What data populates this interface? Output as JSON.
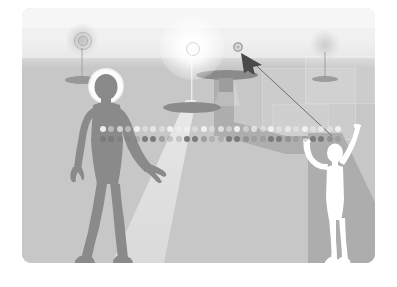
{
  "scene": {
    "title": "Grayscale conceptual illustration: two figures, three lamps, pointer arrow and dotted connection line",
    "palette": {
      "page_background": "#ffffff",
      "sky_light": "#f6f6f6",
      "sky_band": "#efefef",
      "ground": "#c7c7c7",
      "ground_band": "#d8d8d8",
      "dark_figure": "#8a8a8a",
      "dark_figure_deep": "#7e7e7e",
      "white_figure": "#ffffff",
      "shadow_gray": "#acacac",
      "lamp_base_dark": "#8b8b8b",
      "arrow_dark": "#4a4a4a",
      "dot_light": "#f2f2f2",
      "dot_dark": "#7b7b7b",
      "bright_glow": "#ffffff"
    },
    "frame": {
      "x": 22,
      "y": 8,
      "width": 353,
      "height": 255,
      "corner_radius": 9
    }
  },
  "lamps": [
    {
      "name": "left-lamp",
      "label": "Dim lamp with concentric rings",
      "brightness": "dim",
      "glow_color": "#c2c2c2",
      "has_rings": true,
      "pole": true,
      "base_ellipse": true
    },
    {
      "name": "center-lamp",
      "label": "Bright white lamp",
      "brightness": "bright",
      "glow_color": "#ffffff",
      "has_rings": false,
      "pole": true,
      "base_ellipse": true,
      "casts_light_cone": true
    },
    {
      "name": "right-lamp",
      "label": "Faint background lamp",
      "brightness": "faint",
      "glow_color": "#c8c8c8",
      "has_rings": false,
      "pole": true,
      "base_ellipse": true
    },
    {
      "name": "shadow-caster-lamp",
      "label": "Mid lamp disc casting bent shadow",
      "brightness": "none",
      "glow_color": "#8a8a8a",
      "has_rings": false,
      "pole": false,
      "base_ellipse": true,
      "casts_bent_shadow": true
    }
  ],
  "figures": [
    {
      "name": "dark-figure",
      "label": "Dark silhouette figure with white head halo",
      "fill": "#8a8a8a",
      "halo": true,
      "pose": "standing, left arm hanging, right arm reaching forward-right",
      "side": "left"
    },
    {
      "name": "white-figure",
      "label": "White outline figure holding pointer line",
      "fill": "#ffffff",
      "halo": false,
      "pose": "standing, right arm raised up holding line, left arm curved outward",
      "side": "right",
      "casts_shadow": true
    }
  ],
  "pointer": {
    "name": "arrow-cursor",
    "label": "Arrow cursor pointing up-left at small orb",
    "arrow_color": "#4a4a4a",
    "line_color": "#6e6e6e",
    "target_orb": {
      "name": "target-orb",
      "label": "Small circular target",
      "stroke": "#9a9a9a",
      "radius_px": 4
    },
    "line_from": "raised hand of white figure",
    "line_to": "arrow cursor near orb"
  },
  "dot_rows": {
    "name": "dotted-connection-line",
    "label": "Horizontal double row of dots linking the two figures",
    "count": 29,
    "spacing_px": 8.4,
    "top_row": {
      "label": "light dot row",
      "color": "#f2f2f2",
      "diameter_px": 6
    },
    "bottom_row": {
      "label": "dark dot row",
      "color": "#7b7b7b",
      "diameter_px": 6,
      "pattern": "alternating dark / faded groups"
    }
  },
  "background_panels": [
    {
      "name": "bg-panel-1",
      "label": "faint rectangular wall panel"
    },
    {
      "name": "bg-panel-2",
      "label": "faint rectangular wall panel"
    },
    {
      "name": "bg-panel-3",
      "label": "faint rectangular wall panel"
    }
  ]
}
